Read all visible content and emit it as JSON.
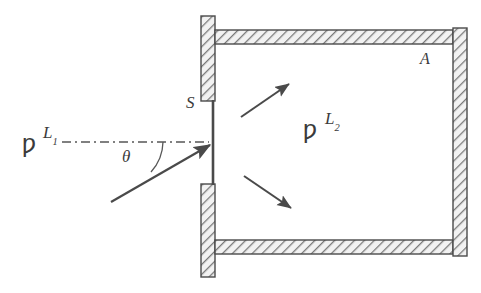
{
  "figure": {
    "background_color": "#ffffff",
    "ink_color": "#3b3b3b",
    "wall_fill_color": "#f0f0f0",
    "hatch_color": "#6e6e6e",
    "labels": {
      "beam_source_label": "L",
      "beam_source_subscript": "1",
      "chamber_label": "L",
      "chamber_subscript": "2",
      "slit_label": "S",
      "area_label": "A",
      "angle_label": "θ",
      "marker_glyph": "ƿ"
    },
    "elements": {
      "slit_name": "slit-S",
      "chamber_name": "chamber-L2",
      "incident_beam_name": "incident-beam",
      "axis_name": "optical-axis",
      "scattered_arrow_up_name": "scattered-ray-up",
      "scattered_arrow_down_name": "scattered-ray-down",
      "wall_top_name": "chamber-wall-top",
      "wall_bottom_name": "chamber-wall-bottom",
      "wall_right_name": "chamber-wall-right",
      "wall_left_upper_name": "chamber-wall-left-upper",
      "wall_left_lower_name": "chamber-wall-left-lower"
    },
    "geometry": {
      "slit_x": 213,
      "slit_y_top": 100,
      "slit_y_bottom": 185,
      "chamber_left": 201,
      "chamber_right": 467,
      "chamber_top": 16,
      "chamber_bottom": 277,
      "wall_thickness": 14,
      "axis_y": 142,
      "axis_x_start": 62,
      "axis_x_end": 212,
      "incident_start_x": 111,
      "incident_start_y": 202,
      "incident_end_x": 210,
      "incident_end_y": 145,
      "angle_degrees": 30
    }
  }
}
